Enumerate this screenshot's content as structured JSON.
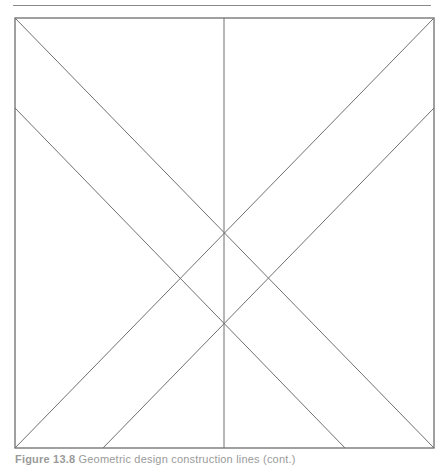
{
  "page": {
    "header_rule": {
      "x1": 13,
      "y1": 5.5,
      "x2": 431,
      "y2": 5.5,
      "color": "#8a8a8a"
    },
    "figure": {
      "frame": {
        "x": 15,
        "y": 18,
        "width": 419,
        "height": 430,
        "stroke": "#6e6e6e"
      },
      "lines": [
        {
          "name": "diagonal-top-left-to-bottom-right",
          "x1": 15,
          "y1": 18,
          "x2": 434,
          "y2": 448
        },
        {
          "name": "diagonal-top-right-to-bottom-left",
          "x1": 434,
          "y1": 18,
          "x2": 15,
          "y2": 448
        },
        {
          "name": "vertical-center-line",
          "x1": 224,
          "y1": 18,
          "x2": 224,
          "y2": 448
        },
        {
          "name": "left-edge-to-bottom-diagonal",
          "x1": 15,
          "y1": 108,
          "x2": 345,
          "y2": 448
        },
        {
          "name": "right-edge-to-bottom-diagonal",
          "x1": 434,
          "y1": 108,
          "x2": 103,
          "y2": 448
        }
      ],
      "line_color": "#707070"
    },
    "caption": {
      "label": "Figure 13.8",
      "text": "Geometric design construction lines (cont.)"
    }
  }
}
